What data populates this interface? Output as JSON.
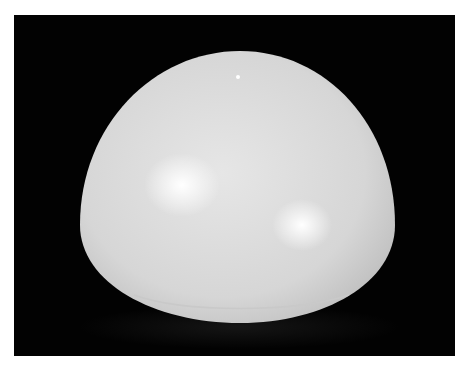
{
  "image": {
    "subject": "white hemisphere dome on black background",
    "colors": {
      "border": "#ffffff",
      "background": "#020202",
      "dome_base": "#d8d8d8",
      "dome_shadow": "#c4c4c4",
      "highlight": "#ffffff"
    }
  }
}
